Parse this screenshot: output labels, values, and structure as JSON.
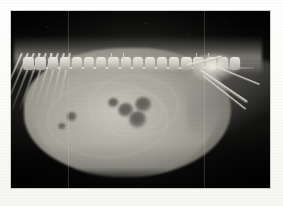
{
  "page": {
    "background_color": "#fdfdfb",
    "width": 283,
    "height": 206
  },
  "figure": {
    "modality": "radiograph",
    "view": "lateral",
    "region": "abdomen",
    "plate": {
      "x": 11,
      "y": 11,
      "width": 259,
      "height": 177,
      "background_color": "#0a0a0a",
      "border_color": "#787878"
    },
    "caption": "",
    "label": "",
    "annotations": []
  },
  "anatomy": {
    "soft_tissue_color": "#a9a69d",
    "bone_color": "#e9e7df",
    "gas_color": "#5c5a54",
    "background_color": "#121211",
    "structures": [
      {
        "name": "lumbar-spine",
        "note": "vertebral chain along dorsal third"
      },
      {
        "name": "ribs",
        "note": "caudal rib arcs over cranial abdomen"
      },
      {
        "name": "abdominal-mass",
        "note": "large rounded soft-tissue opacity distending abdomen"
      },
      {
        "name": "gas-lucencies",
        "note": "cluster of rounded lucent foci mid-abdomen"
      },
      {
        "name": "pelvis",
        "note": "caudal, superimposed on hind limb"
      },
      {
        "name": "femur",
        "note": "oblique long bone caudoventral"
      },
      {
        "name": "ventral-body-wall",
        "note": "smooth convex ventral margin"
      }
    ]
  },
  "vertebrae": {
    "count": 18,
    "start_pct": 3,
    "step_pct": 5.1
  },
  "ribs": {
    "count": 9,
    "start_pct": 4,
    "step_pct": 5.0,
    "angle_start_deg": 24,
    "angle_step_deg": -1.4
  },
  "lucencies": [
    {
      "name": "gas-focus-1",
      "left_pct": 41.5,
      "top_pct": 52.0,
      "w_pct": 6.0,
      "h_pct": 8.5
    },
    {
      "name": "gas-focus-2",
      "left_pct": 45.5,
      "top_pct": 56.5,
      "w_pct": 7.0,
      "h_pct": 10.0
    },
    {
      "name": "gas-focus-3",
      "left_pct": 48.0,
      "top_pct": 48.5,
      "w_pct": 6.5,
      "h_pct": 9.0
    },
    {
      "name": "gas-focus-4",
      "left_pct": 37.5,
      "top_pct": 49.0,
      "w_pct": 4.2,
      "h_pct": 6.0
    },
    {
      "name": "gas-focus-5",
      "left_pct": 21.5,
      "top_pct": 57.0,
      "w_pct": 4.0,
      "h_pct": 5.5
    },
    {
      "name": "gas-focus-6",
      "left_pct": 18.0,
      "top_pct": 63.0,
      "w_pct": 3.2,
      "h_pct": 4.5
    }
  ],
  "swirls": [
    {
      "name": "serosal-swirl-1",
      "left_pct": 30,
      "top_pct": 36,
      "w_pct": 34,
      "h_pct": 34
    },
    {
      "name": "serosal-swirl-2",
      "left_pct": 36,
      "top_pct": 44,
      "w_pct": 22,
      "h_pct": 24
    },
    {
      "name": "serosal-swirl-3",
      "left_pct": 14,
      "top_pct": 40,
      "w_pct": 46,
      "h_pct": 42
    }
  ],
  "artifacts": {
    "vertical_scanline_pct": 74.5,
    "vertical_scanline_2_pct": 22.0
  }
}
